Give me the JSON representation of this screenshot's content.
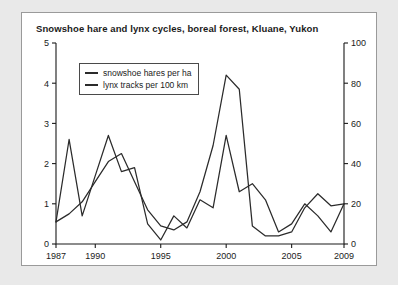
{
  "chart_data": {
    "type": "line",
    "title": "Snowshoe hare and lynx cycles, boreal forest, Kluane, Yukon",
    "xlabel": "",
    "ylabel": "",
    "grid": false,
    "legend_position": "top-left",
    "xlim": [
      1987,
      2009
    ],
    "xticks": [
      "1987",
      "1990",
      "1995",
      "2000",
      "2005",
      "2009"
    ],
    "xtick_values": [
      1987,
      1990,
      1995,
      2000,
      2005,
      2009
    ],
    "left_axis": {
      "label": "snowshoe hares per ha",
      "ylim": [
        0,
        5
      ],
      "yticks": [
        "0",
        "1",
        "2",
        "3",
        "4",
        "5"
      ],
      "ytick_values": [
        0,
        1,
        2,
        3,
        4,
        5
      ]
    },
    "right_axis": {
      "label": "lynx tracks per 100 km",
      "ylim": [
        0,
        100
      ],
      "yticks": [
        "0",
        "20",
        "40",
        "60",
        "80",
        "100"
      ],
      "ytick_values": [
        0,
        20,
        40,
        60,
        80,
        100
      ]
    },
    "x": [
      1987,
      1988,
      1989,
      1990,
      1991,
      1992,
      1993,
      1994,
      1995,
      1996,
      1997,
      1998,
      1999,
      2000,
      2001,
      2002,
      2003,
      2004,
      2005,
      2006,
      2007,
      2008,
      2009
    ],
    "series": [
      {
        "name": "snowshoe hares per ha",
        "axis": "left",
        "units": "hares per ha",
        "values": [
          0.55,
          0.75,
          1.05,
          1.55,
          2.05,
          2.25,
          1.55,
          0.85,
          0.45,
          0.35,
          0.55,
          1.3,
          2.45,
          4.2,
          3.85,
          0.45,
          0.2,
          0.2,
          0.3,
          0.9,
          1.25,
          0.95,
          1.0
        ]
      },
      {
        "name": "lynx tracks per 100 km",
        "axis": "right",
        "units": "tracks per 100 km",
        "values": [
          11,
          52,
          14,
          34,
          54,
          36,
          38,
          10,
          2,
          14,
          8,
          22,
          18,
          54,
          26,
          30,
          22,
          6,
          10,
          20,
          14,
          6,
          20
        ]
      }
    ]
  },
  "legend": {
    "entries": [
      {
        "label": "snowshoe hares per ha"
      },
      {
        "label": "lynx tracks per 100 km"
      }
    ]
  }
}
